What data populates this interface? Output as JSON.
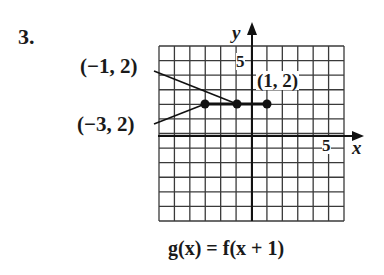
{
  "problem": {
    "number": "3."
  },
  "graph": {
    "function_label": "g(x) = f(x + 1)",
    "axes": {
      "x_label": "x",
      "y_label": "y",
      "x_tick_label": "5",
      "y_tick_label": "5"
    },
    "grid": {
      "x_range": [
        -6,
        6
      ],
      "y_range": [
        -6,
        6
      ],
      "step": 1
    },
    "points": [
      {
        "label": "(−3, 2)",
        "x": -3,
        "y": 2
      },
      {
        "label": "(−1, 2)",
        "x": -1,
        "y": 2
      },
      {
        "label": "(1, 2)",
        "x": 1,
        "y": 2
      }
    ],
    "segment": {
      "from": [
        -3,
        2
      ],
      "to": [
        1,
        2
      ]
    },
    "colors": {
      "ink": "#1a1a1a",
      "grid": "#3a3a3a",
      "background": "#ffffff"
    }
  }
}
